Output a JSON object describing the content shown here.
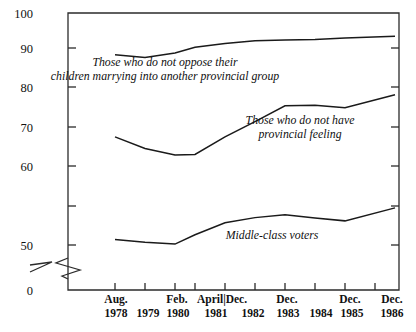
{
  "chart_data": {
    "type": "line",
    "title": "",
    "subtitle": "",
    "xlabel": "",
    "ylabel": "",
    "ylim": [
      0,
      100
    ],
    "y_axis_break": true,
    "y_break_between": [
      0,
      50
    ],
    "grid": false,
    "legend_position": "inline-annotations",
    "yticks": [
      "0",
      "50",
      "60",
      "70",
      "80",
      "90",
      "100"
    ],
    "x": [
      "Aug. 1978",
      "1979",
      "Feb. 1980",
      "April 1981",
      "Dec. 1981",
      "1982",
      "Dec. 1983",
      "1984",
      "Dec. 1985",
      "Dec. 1986"
    ],
    "xtick_top_labels": [
      "Aug.",
      "",
      "Feb.",
      "April|Dec.",
      "",
      "Dec.",
      "",
      "Dec.",
      "Dec."
    ],
    "xtick_bottom_labels": [
      "1978",
      "1979",
      "1980",
      "1981",
      "1982",
      "1983",
      "1984",
      "1985",
      "1986"
    ],
    "series": [
      {
        "name": "Those who do not oppose their children marrying into another provincial group",
        "values": [
          91.0,
          90.4,
          91.4,
          92.6,
          93.4,
          94.0,
          94.2,
          94.3,
          94.6,
          95.0
        ]
      },
      {
        "name": "Those who do not have provincial feeling",
        "values": [
          73.3,
          70.8,
          69.4,
          69.5,
          73.3,
          76.6,
          80.0,
          80.1,
          79.6,
          82.4
        ]
      },
      {
        "name": "Middle-class voters",
        "values": [
          51.2,
          50.6,
          50.2,
          52.2,
          54.8,
          55.9,
          56.5,
          55.8,
          55.2,
          58.0
        ]
      }
    ],
    "annotations": [
      {
        "id": "annotation-no-oppose",
        "lines": [
          "Those who do not oppose their",
          "children marrying into another provincial group"
        ]
      },
      {
        "id": "annotation-no-provincial-feeling",
        "lines": [
          "Those who do not have",
          "provincial feeling"
        ]
      },
      {
        "id": "annotation-middle-class",
        "lines": [
          "Middle-class voters"
        ]
      }
    ],
    "colors": {
      "line": "#1a1a1a",
      "axis": "#2b2b2b",
      "text": "#111111",
      "background": "#ffffff"
    }
  }
}
